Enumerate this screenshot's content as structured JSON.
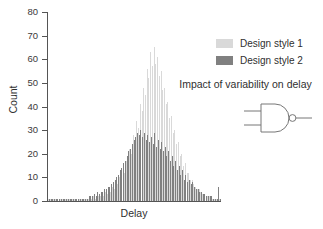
{
  "chart_data": {
    "type": "bar",
    "title": "Impact of variability on delay",
    "xlabel": "Delay",
    "ylabel": "Count",
    "ylim": [
      0,
      80
    ],
    "xlim": [
      0,
      100
    ],
    "yticks": [
      0,
      10,
      20,
      30,
      40,
      50,
      60,
      70,
      80
    ],
    "ytick_labels": [
      "0",
      "10",
      "20",
      "30",
      "40",
      "50",
      "60",
      "70",
      "80"
    ],
    "xticks": [],
    "xtick_labels": [],
    "grid": false,
    "legend_position": "upper right",
    "bar_style": "overlaid-histogram",
    "series": [
      {
        "name": "Design style 1",
        "color": "#d9d9d9",
        "values": [
          1,
          1,
          1,
          1,
          1,
          1,
          1,
          1,
          1,
          1,
          1,
          1,
          1,
          1,
          1,
          1,
          1,
          1,
          1,
          1,
          1,
          1,
          1,
          1,
          2,
          1,
          2,
          1,
          2,
          2,
          2,
          3,
          2,
          4,
          3,
          5,
          4,
          6,
          5,
          8,
          7,
          10,
          9,
          13,
          12,
          17,
          15,
          22,
          20,
          28,
          25,
          34,
          31,
          41,
          38,
          48,
          45,
          56,
          52,
          63,
          57,
          65,
          58,
          61,
          53,
          55,
          47,
          48,
          41,
          42,
          35,
          36,
          29,
          30,
          24,
          25,
          19,
          20,
          15,
          16,
          12,
          12,
          9,
          9,
          7,
          6,
          5,
          5,
          4,
          3,
          3,
          2,
          2,
          2,
          1,
          1,
          1,
          1,
          1,
          1
        ]
      },
      {
        "name": "Design style 2",
        "color": "#808080",
        "values": [
          1,
          1,
          1,
          1,
          1,
          1,
          1,
          1,
          1,
          1,
          1,
          1,
          1,
          1,
          1,
          1,
          1,
          1,
          1,
          1,
          1,
          1,
          1,
          2,
          2,
          2,
          3,
          2,
          4,
          3,
          4,
          4,
          5,
          5,
          6,
          6,
          7,
          8,
          9,
          10,
          11,
          13,
          14,
          16,
          17,
          19,
          21,
          22,
          24,
          26,
          27,
          29,
          28,
          30,
          27,
          29,
          26,
          28,
          25,
          27,
          24,
          29,
          23,
          26,
          22,
          25,
          21,
          23,
          19,
          21,
          17,
          19,
          15,
          17,
          13,
          15,
          11,
          13,
          9,
          11,
          8,
          9,
          7,
          8,
          6,
          5,
          5,
          4,
          4,
          3,
          3,
          2,
          2,
          2,
          2,
          1,
          1,
          1,
          6,
          1
        ]
      }
    ]
  },
  "annotation": {
    "title": "Impact of variability on delay",
    "gate_label": "nand-gate-symbol"
  },
  "legend": {
    "items": [
      {
        "label": "Design style 1",
        "color": "#d9d9d9"
      },
      {
        "label": "Design style 2",
        "color": "#808080"
      }
    ]
  },
  "colors": {
    "axis": "#555555",
    "text": "#2f2f2f",
    "background": "#ffffff",
    "series1": "#d9d9d9",
    "series2": "#808080",
    "gate_stroke": "#777777"
  }
}
